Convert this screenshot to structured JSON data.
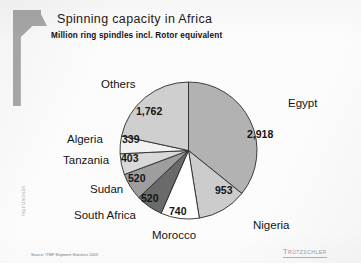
{
  "slide": {
    "title": "Spinning capacity in Africa",
    "subtitle": "Million ring spindles incl. Rotor equivalent",
    "source": "Source: ITMF Shipment Statistics 2003",
    "side_code": "TRUETZSCHLER",
    "logo": "Trützschler",
    "background_color": "#fcfcfc",
    "accent_color": "#a9a9a9"
  },
  "chart_data": {
    "type": "pie",
    "title": "Spinning capacity in Africa",
    "subtitle": "Million ring spindles incl. Rotor equivalent",
    "xlabel": "",
    "ylabel": "",
    "legend": "none",
    "grid": false,
    "start_angle_deg": 0,
    "direction": "clockwise",
    "total": 8155,
    "categories": [
      "Egypt",
      "Nigeria",
      "Morocco",
      "South Africa",
      "Sudan",
      "Tanzania",
      "Algeria",
      "Others"
    ],
    "values": [
      2918,
      953,
      740,
      520,
      520,
      403,
      339,
      1762
    ],
    "value_labels": [
      "2,918",
      "953",
      "740",
      "520",
      "520",
      "403",
      "339",
      "1,762"
    ],
    "slice_colors": [
      "#b2b2b2",
      "#cccccc",
      "#ffffff",
      "#6a6a6a",
      "#9e9e9e",
      "#d8d8d8",
      "#f2f2f2",
      "#cfcfcf"
    ],
    "slice_stroke": "#2b2b2b"
  }
}
